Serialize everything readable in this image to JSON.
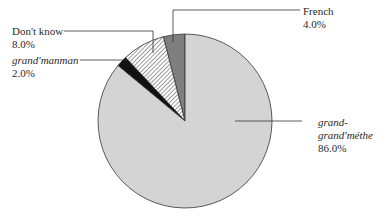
{
  "chart_data": {
    "type": "pie",
    "title": "",
    "start_angle_deg": 90,
    "direction": "counterclockwise",
    "slices": [
      {
        "label": "French",
        "value": 4.0,
        "display": "4.0%",
        "color": "#7f7f7f",
        "pattern": "solid",
        "italic": false
      },
      {
        "label": "Don't know",
        "value": 8.0,
        "display": "8.0%",
        "color": "#ffffff",
        "pattern": "hatch",
        "italic": false
      },
      {
        "label": "grand'manman",
        "value": 2.0,
        "display": "2.0%",
        "color": "#111111",
        "pattern": "solid",
        "italic": true
      },
      {
        "label": "grand-grand'méthe",
        "value": 86.0,
        "display": "86.0%",
        "color": "#d4d4d4",
        "pattern": "solid",
        "italic": true
      }
    ],
    "legend": "none"
  },
  "labels": {
    "french": {
      "name": "French",
      "value": "4.0%"
    },
    "dont_know": {
      "name": "Don't know",
      "value": "8.0%"
    },
    "grandmanman": {
      "name": "grand'manman",
      "value": "2.0%"
    },
    "grandgrand": {
      "name_line1": "grand-",
      "name_line2": "grand'méthe",
      "value": "86.0%"
    }
  }
}
